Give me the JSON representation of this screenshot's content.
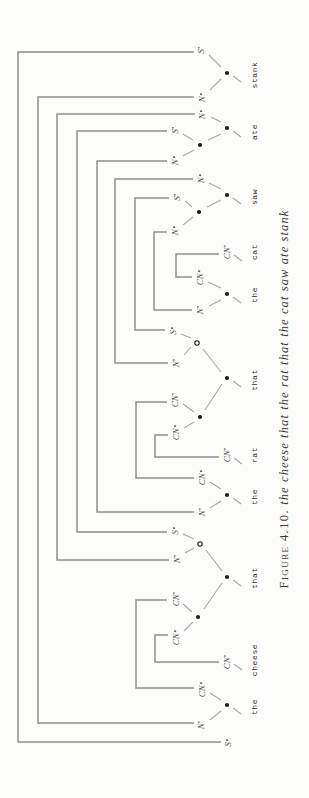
{
  "figure": {
    "caption_label": "Figure 4.10.",
    "caption_sentence": "the cheese that the rat that the cat saw ate stank"
  },
  "colors": {
    "paper": "#fcfcfa",
    "bracket": "#8e8e8e",
    "edge": "#a8a8a8",
    "label": "#4a4a4a",
    "word": "#2a2a2a",
    "dot": "#1b1b1b",
    "caption": "#3a3a3a"
  },
  "diagram": {
    "word_y": 254,
    "words": [
      {
        "text": "the",
        "x": 91
      },
      {
        "text": "cheese",
        "x": 138
      },
      {
        "text": "that",
        "x": 220
      },
      {
        "text": "the",
        "x": 301
      },
      {
        "text": "rat",
        "x": 343
      },
      {
        "text": "that",
        "x": 418
      },
      {
        "text": "the",
        "x": 503
      },
      {
        "text": "cat",
        "x": 546
      },
      {
        "text": "saw",
        "x": 601
      },
      {
        "text": "ate",
        "x": 666
      },
      {
        "text": "stank",
        "x": 723
      }
    ],
    "leaves": [
      {
        "id": "goal-S",
        "base": "S",
        "sup": "∘",
        "x": 56,
        "y": 228
      },
      {
        "id": "the1-N",
        "base": "N",
        "sup": "•",
        "x": 73,
        "y": 201
      },
      {
        "id": "the1-CN",
        "base": "CN",
        "sup": "∘",
        "x": 109,
        "y": 202
      },
      {
        "id": "cheese-CN",
        "base": "CN",
        "sup": "•",
        "x": 136,
        "y": 227
      },
      {
        "id": "that3-CN-arg",
        "base": "CN",
        "sup": "∘",
        "x": 161,
        "y": 176
      },
      {
        "id": "that3-CN-val",
        "base": "CN",
        "sup": "•",
        "x": 199,
        "y": 176
      },
      {
        "id": "that3-N",
        "base": "N",
        "sup": "•",
        "x": 239,
        "y": 177
      },
      {
        "id": "that3-S",
        "base": "S",
        "sup": "∘",
        "x": 268,
        "y": 175
      },
      {
        "id": "the4-N",
        "base": "N",
        "sup": "•",
        "x": 286,
        "y": 202
      },
      {
        "id": "the4-CN",
        "base": "CN",
        "sup": "∘",
        "x": 321,
        "y": 202
      },
      {
        "id": "rat-CN",
        "base": "CN",
        "sup": "•",
        "x": 343,
        "y": 227
      },
      {
        "id": "that6-CN-arg",
        "base": "CN",
        "sup": "∘",
        "x": 366,
        "y": 176
      },
      {
        "id": "that6-CN-val",
        "base": "CN",
        "sup": "•",
        "x": 398,
        "y": 175
      },
      {
        "id": "that6-N",
        "base": "N",
        "sup": "•",
        "x": 435,
        "y": 176
      },
      {
        "id": "that6-S",
        "base": "S",
        "sup": "∘",
        "x": 468,
        "y": 173
      },
      {
        "id": "the7-N",
        "base": "N",
        "sup": "•",
        "x": 488,
        "y": 200
      },
      {
        "id": "the7-CN",
        "base": "CN",
        "sup": "∘",
        "x": 521,
        "y": 200
      },
      {
        "id": "cat-CN",
        "base": "CN",
        "sup": "•",
        "x": 546,
        "y": 227
      },
      {
        "id": "saw-N-subj",
        "base": "N",
        "sup": "∘",
        "x": 568,
        "y": 175
      },
      {
        "id": "saw-S",
        "base": "S",
        "sup": "•",
        "x": 601,
        "y": 177
      },
      {
        "id": "saw-N-obj",
        "base": "N",
        "sup": "∘",
        "x": 620,
        "y": 201
      },
      {
        "id": "ate-N-subj",
        "base": "N",
        "sup": "∘",
        "x": 638,
        "y": 175
      },
      {
        "id": "ate-S",
        "base": "S",
        "sup": "•",
        "x": 668,
        "y": 175
      },
      {
        "id": "ate-N-obj",
        "base": "N",
        "sup": "∘",
        "x": 684,
        "y": 202
      },
      {
        "id": "stank-N",
        "base": "N",
        "sup": "∘",
        "x": 701,
        "y": 202
      },
      {
        "id": "stank-S",
        "base": "S",
        "sup": "•",
        "x": 748,
        "y": 201
      }
    ],
    "dots": [
      {
        "x": 93,
        "y": 227
      },
      {
        "x": 221,
        "y": 227
      },
      {
        "x": 303,
        "y": 227
      },
      {
        "x": 420,
        "y": 227
      },
      {
        "x": 504,
        "y": 227
      },
      {
        "x": 603,
        "y": 227
      },
      {
        "x": 670,
        "y": 227
      },
      {
        "x": 725,
        "y": 227
      },
      {
        "x": 181,
        "y": 198
      },
      {
        "x": 381,
        "y": 200
      },
      {
        "x": 586,
        "y": 199
      },
      {
        "x": 653,
        "y": 200
      }
    ],
    "open_dots": [
      {
        "x": 254,
        "y": 200
      },
      {
        "x": 455,
        "y": 197
      }
    ],
    "edges": [
      [
        87,
        221,
        78,
        210
      ],
      [
        98,
        221,
        105,
        210
      ],
      [
        215,
        222,
        189,
        204
      ],
      [
        176,
        193,
        167,
        184
      ],
      [
        186,
        192,
        194,
        183
      ],
      [
        227,
        222,
        248,
        206
      ],
      [
        250,
        194,
        245,
        185
      ],
      [
        259,
        194,
        264,
        183
      ],
      [
        297,
        221,
        290,
        210
      ],
      [
        309,
        221,
        316,
        210
      ],
      [
        414,
        222,
        388,
        205
      ],
      [
        376,
        194,
        370,
        184
      ],
      [
        386,
        194,
        394,
        183
      ],
      [
        426,
        221,
        449,
        203
      ],
      [
        451,
        191,
        443,
        184
      ],
      [
        460,
        191,
        464,
        181
      ],
      [
        498,
        221,
        492,
        209
      ],
      [
        510,
        221,
        516,
        208
      ],
      [
        598,
        221,
        591,
        207
      ],
      [
        581,
        193,
        573,
        183
      ],
      [
        591,
        192,
        597,
        185
      ],
      [
        609,
        221,
        615,
        209
      ],
      [
        664,
        221,
        658,
        208
      ],
      [
        648,
        194,
        642,
        183
      ],
      [
        658,
        193,
        664,
        183
      ],
      [
        676,
        221,
        681,
        211
      ],
      [
        719,
        221,
        708,
        210
      ],
      [
        731,
        221,
        743,
        209
      ]
    ],
    "ticks": [
      [
        90,
        233,
        84,
        241
      ],
      [
        134,
        234,
        128,
        242
      ],
      [
        218,
        233,
        212,
        241
      ],
      [
        300,
        233,
        294,
        241
      ],
      [
        340,
        234,
        334,
        242
      ],
      [
        417,
        233,
        411,
        241
      ],
      [
        501,
        233,
        495,
        241
      ],
      [
        543,
        234,
        537,
        242
      ],
      [
        600,
        233,
        594,
        241
      ],
      [
        667,
        233,
        661,
        241
      ],
      [
        722,
        233,
        716,
        241
      ]
    ],
    "links": [
      {
        "id": "S-goal--S-stank",
        "pts": "56,221 56,18 746,18 746,194"
      },
      {
        "id": "N-the1--N-stank",
        "pts": "75,194 75,38 701,38 701,194"
      },
      {
        "id": "N-that3--N-ate",
        "pts": "238,169 238,57 684,57 684,195"
      },
      {
        "id": "S-that3--S-ate",
        "pts": "266,167 266,77 667,77 667,167"
      },
      {
        "id": "N-the4--N-ate",
        "pts": "286,194 286,97 637,97 637,167"
      },
      {
        "id": "N-that6--N-saw",
        "pts": "435,168 435,115 619,115 619,193"
      },
      {
        "id": "S-that6--S-saw",
        "pts": "468,165 468,135 600,135 600,169"
      },
      {
        "id": "N-the7--N-saw",
        "pts": "488,192 488,154 566,154 566,167"
      },
      {
        "id": "CN-the7--CN-cat",
        "pts": "521,192 521,176 544,176 544,219"
      },
      {
        "id": "CN-the4--CN-that6",
        "pts": "320,194 320,136 396,136 396,167"
      },
      {
        "id": "CN-rat--CN-that6",
        "pts": "341,219 341,155 363,155 363,168"
      },
      {
        "id": "CN-the1--CN-that3",
        "pts": "110,194 110,136 198,136 198,167"
      },
      {
        "id": "CN-cheese--CN-that3",
        "pts": "136,219 136,155 163,155 163,168"
      }
    ]
  }
}
